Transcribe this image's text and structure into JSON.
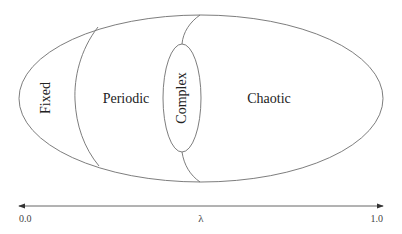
{
  "diagram": {
    "regions": [
      {
        "id": "fixed",
        "label": "Fixed",
        "orientation": "vertical"
      },
      {
        "id": "periodic",
        "label": "Periodic",
        "orientation": "horizontal"
      },
      {
        "id": "complex",
        "label": "Complex",
        "orientation": "vertical"
      },
      {
        "id": "chaotic",
        "label": "Chaotic",
        "orientation": "horizontal"
      }
    ],
    "axis": {
      "min_label": "0.0",
      "max_label": "1.0",
      "variable_label": "λ",
      "bidirectional": true
    },
    "colors": {
      "line": "#6e6e6e",
      "text": "#222222",
      "background": "#ffffff"
    }
  }
}
